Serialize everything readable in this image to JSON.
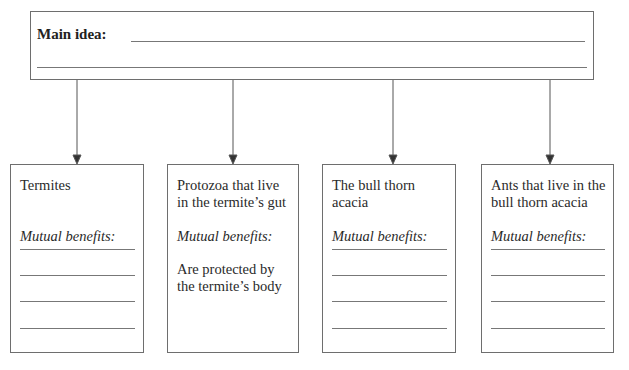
{
  "main_box": {
    "label": "Main idea:",
    "answer_lines": 2
  },
  "cards": [
    {
      "title": "Termites",
      "subtitle": "Mutual benefits:",
      "text": "",
      "blank_lines": 4
    },
    {
      "title": "Protozoa that live in the termite’s gut",
      "subtitle": "Mutual benefits:",
      "text": "Are protected by the termite’s body",
      "blank_lines": 0
    },
    {
      "title": "The bull thorn acacia",
      "subtitle": "Mutual benefits:",
      "text": "",
      "blank_lines": 4
    },
    {
      "title": "Ants that live in the bull thorn acacia",
      "subtitle": "Mutual benefits:",
      "text": "",
      "blank_lines": 4
    }
  ],
  "colors": {
    "border": "#6e6e6e",
    "text": "#2a2a2a",
    "background": "#ffffff"
  }
}
